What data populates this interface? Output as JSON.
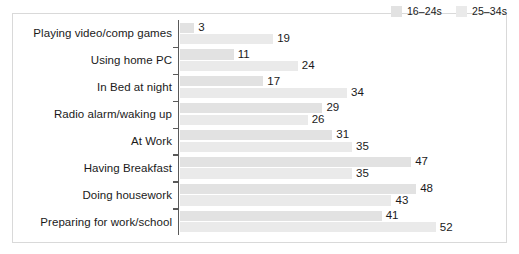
{
  "chart_data": {
    "type": "bar",
    "orientation": "horizontal",
    "title": "",
    "subtitle": "",
    "xlabel": "",
    "ylabel": "",
    "grid": false,
    "legend_position": "top-right",
    "xlim": [
      0,
      60
    ],
    "categories": [
      "Playing video/comp games",
      "Using home PC",
      "In Bed at night",
      "Radio alarm/waking up",
      "At Work",
      "Having Breakfast",
      "Doing housework",
      "Preparing for work/school"
    ],
    "series": [
      {
        "name": "16–24s",
        "color": "#e2e2e2",
        "values": [
          3,
          11,
          17,
          29,
          31,
          47,
          48,
          41
        ]
      },
      {
        "name": "25–34s",
        "color": "#eaeaea",
        "values": [
          19,
          24,
          34,
          26,
          35,
          35,
          43,
          52
        ]
      }
    ]
  },
  "legend": {
    "items": [
      {
        "label": "16–24s",
        "color": "#e2e2e2"
      },
      {
        "label": "25–34s",
        "color": "#eaeaea"
      }
    ]
  },
  "scale": {
    "px_per_unit": 4.93
  }
}
